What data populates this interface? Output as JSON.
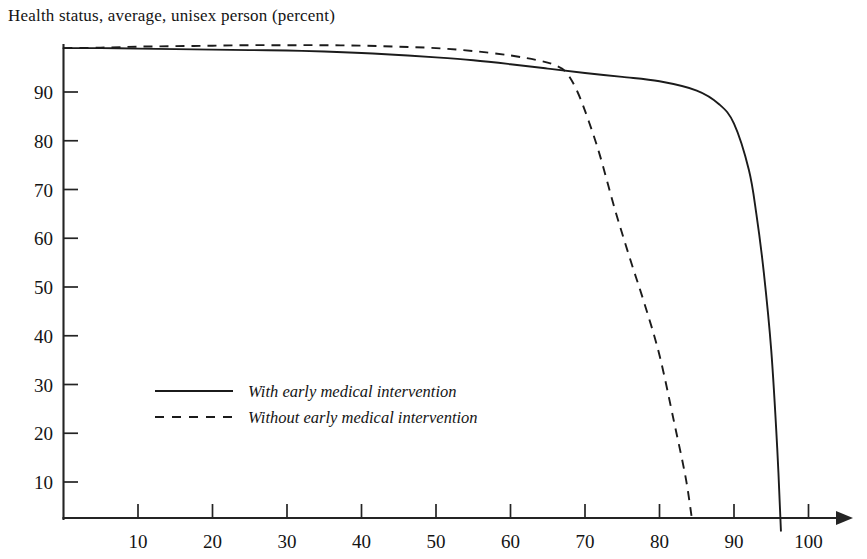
{
  "chart_data": {
    "type": "line",
    "title": "Health status, average, unisex person (percent)",
    "xlabel": "",
    "ylabel": "",
    "xlim": [
      0,
      103
    ],
    "ylim": [
      0,
      100
    ],
    "grid": false,
    "legend_position": "center-left",
    "x_ticks": [
      10,
      20,
      30,
      40,
      50,
      60,
      70,
      80,
      90,
      100
    ],
    "y_ticks": [
      10,
      20,
      30,
      40,
      50,
      60,
      70,
      80,
      90
    ],
    "x_tick_labels": [
      "10",
      "20",
      "30",
      "40",
      "50",
      "60",
      "70",
      "80",
      "90",
      "100"
    ],
    "y_tick_labels": [
      "10",
      "20",
      "30",
      "40",
      "50",
      "60",
      "70",
      "80",
      "90"
    ],
    "series": [
      {
        "name": "With early medical intervention",
        "style": "solid",
        "color": "#1b1b1b",
        "x": [
          0,
          5,
          10,
          15,
          20,
          25,
          30,
          35,
          40,
          45,
          50,
          55,
          60,
          65,
          70,
          75,
          80,
          85,
          88,
          90,
          92,
          93,
          94,
          95,
          95.8,
          96.3
        ],
        "y": [
          99.0,
          99.0,
          98.9,
          98.8,
          98.7,
          98.6,
          98.5,
          98.3,
          98.0,
          97.6,
          97.1,
          96.5,
          95.7,
          94.8,
          93.9,
          93.1,
          92.2,
          90.3,
          87.5,
          83.5,
          74.0,
          65.0,
          53.0,
          37.0,
          17.0,
          0.0
        ]
      },
      {
        "name": "Without early medical intervention",
        "style": "dashed",
        "color": "#1b1b1b",
        "x": [
          0,
          5,
          10,
          15,
          20,
          25,
          30,
          35,
          40,
          45,
          50,
          55,
          60,
          64,
          66,
          67.5,
          69,
          70.5,
          72,
          74,
          76,
          78,
          80,
          82,
          83.5,
          84.3
        ],
        "y": [
          99.0,
          99.1,
          99.3,
          99.4,
          99.5,
          99.6,
          99.6,
          99.6,
          99.5,
          99.3,
          99.0,
          98.4,
          97.5,
          96.4,
          95.5,
          94.0,
          90.0,
          84.0,
          77.0,
          66.0,
          56.0,
          46.5,
          36.0,
          22.0,
          11.0,
          3.0
        ]
      }
    ]
  },
  "legend": {
    "items": [
      {
        "label": "With early medical intervention",
        "style": "solid"
      },
      {
        "label": "Without early medical intervention",
        "style": "dashed"
      }
    ]
  },
  "axis": {
    "x_axis_name": "age-axis",
    "y_axis_name": "health-status-axis",
    "arrow": "right-arrow"
  }
}
